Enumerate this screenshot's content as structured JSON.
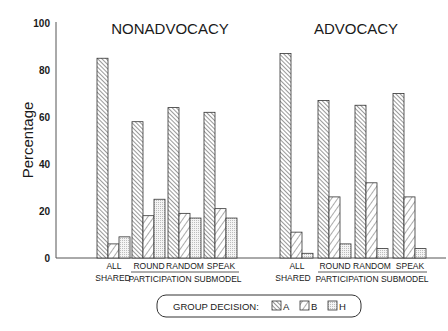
{
  "chart_data": [
    {
      "type": "bar",
      "title": "NONADVOCACY",
      "xlabel": "",
      "ylabel": "Percentage",
      "ylim": [
        0,
        100
      ],
      "yticks": [
        0,
        20,
        40,
        60,
        80,
        100
      ],
      "categories": [
        "ALL SHARED",
        "ROUND",
        "RANDOM",
        "SPEAK"
      ],
      "category_group_label": "PARTICIPATION SUBMODEL",
      "series": [
        {
          "name": "A",
          "pattern": "dense-backslash",
          "values": [
            85,
            58,
            64,
            62
          ]
        },
        {
          "name": "B",
          "pattern": "sparse-slash",
          "values": [
            6,
            18,
            19,
            21
          ]
        },
        {
          "name": "H",
          "pattern": "dotted-grid",
          "values": [
            9,
            25,
            17,
            17
          ]
        }
      ],
      "grid": false
    },
    {
      "type": "bar",
      "title": "ADVOCACY",
      "xlabel": "",
      "ylabel": "Percentage",
      "ylim": [
        0,
        100
      ],
      "yticks": [
        0,
        20,
        40,
        60,
        80,
        100
      ],
      "categories": [
        "ALL SHARED",
        "ROUND",
        "RANDOM",
        "SPEAK"
      ],
      "category_group_label": "PARTICIPATION SUBMODEL",
      "series": [
        {
          "name": "A",
          "pattern": "dense-backslash",
          "values": [
            87,
            67,
            65,
            70
          ]
        },
        {
          "name": "B",
          "pattern": "sparse-slash",
          "values": [
            11,
            26,
            32,
            26
          ]
        },
        {
          "name": "H",
          "pattern": "dotted-grid",
          "values": [
            2,
            6,
            4,
            4
          ]
        }
      ],
      "grid": false
    }
  ],
  "axis": {
    "ylabel": "Percentage",
    "ticks": [
      "0",
      "20",
      "40",
      "60",
      "80",
      "100"
    ]
  },
  "panels": [
    {
      "title": "NONADVOCACY",
      "cat1_line1": "ALL",
      "cat1_line2": "SHARED",
      "cat2": "ROUND",
      "cat3": "RANDOM",
      "cat4": "SPEAK",
      "group_label": "PARTICIPATION SUBMODEL"
    },
    {
      "title": "ADVOCACY",
      "cat1_line1": "ALL",
      "cat1_line2": "SHARED",
      "cat2": "ROUND",
      "cat3": "RANDOM",
      "cat4": "SPEAK",
      "group_label": "PARTICIPATION SUBMODEL"
    }
  ],
  "legend": {
    "title": "GROUP DECISION:",
    "items": [
      {
        "label": "A"
      },
      {
        "label": "B"
      },
      {
        "label": "H"
      }
    ]
  },
  "colors": {
    "ink": "#222222",
    "background": "#ffffff"
  }
}
